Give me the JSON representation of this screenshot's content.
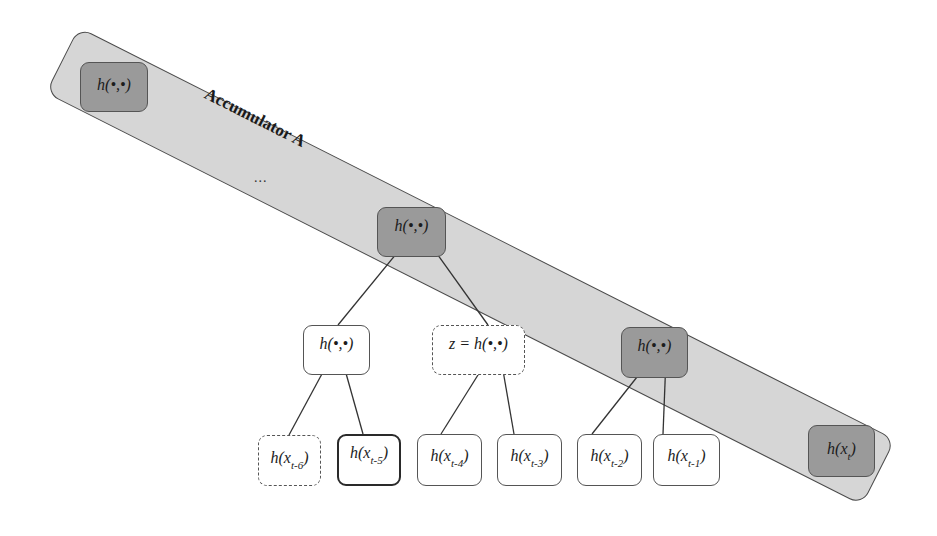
{
  "diagram": {
    "accumulator": {
      "label": "Accumulator A",
      "ellipsis": "...",
      "fill": "#d6d6d6",
      "stroke": "#4a4a4a"
    },
    "colors": {
      "accumulator_node_fill": "#9a9a9a",
      "plain_node_fill": "#ffffff",
      "edge": "#333333"
    },
    "nodes": {
      "acc_first": {
        "label": "h(•,•)",
        "style": "dark"
      },
      "acc_top": {
        "label": "h(•,•)",
        "style": "dark"
      },
      "acc_right": {
        "label": "h(•,•)",
        "style": "dark"
      },
      "acc_last": {
        "label_base": "h(x",
        "label_sub": "t",
        "label_end": ")",
        "style": "dark"
      },
      "mid_left": {
        "label": "h(•,•)",
        "style": "plain"
      },
      "mid_z": {
        "label": "z = h(•,•)",
        "style": "dashed"
      },
      "leaves": [
        {
          "label_base": "h(x",
          "label_sub": "t-6",
          "label_end": ")",
          "style": "dashed"
        },
        {
          "label_base": "h(x",
          "label_sub": "t-5",
          "label_end": ")",
          "style": "bold"
        },
        {
          "label_base": "h(x",
          "label_sub": "t-4",
          "label_end": ")",
          "style": "plain"
        },
        {
          "label_base": "h(x",
          "label_sub": "t-3",
          "label_end": ")",
          "style": "plain"
        },
        {
          "label_base": "h(x",
          "label_sub": "t-2",
          "label_end": ")",
          "style": "plain"
        },
        {
          "label_base": "h(x",
          "label_sub": "t-1",
          "label_end": ")",
          "style": "plain"
        }
      ]
    },
    "edges": [
      {
        "from": "leaf t-6",
        "to": "mid_left"
      },
      {
        "from": "leaf t-5",
        "to": "mid_left"
      },
      {
        "from": "leaf t-4",
        "to": "mid_z"
      },
      {
        "from": "leaf t-3",
        "to": "mid_z"
      },
      {
        "from": "leaf t-2",
        "to": "acc_right"
      },
      {
        "from": "leaf t-1",
        "to": "acc_right"
      },
      {
        "from": "mid_left",
        "to": "acc_top"
      },
      {
        "from": "mid_z",
        "to": "acc_top"
      }
    ]
  }
}
